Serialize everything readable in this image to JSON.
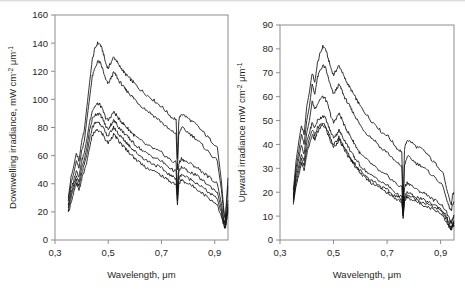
{
  "figure": {
    "panels": [
      {
        "id": "left",
        "name": "downwelling-irradiance-plot",
        "xlabel": "Wavelength, μm",
        "ylabel_main": "Downwelling irradiance, mW cm",
        "ylabel_sup1": "-2",
        "ylabel_mid": " μm",
        "ylabel_sup2": "-1",
        "xticks": [
          "0,3",
          "0,5",
          "0,7",
          "0,9"
        ],
        "xtickvals": [
          0.3,
          0.5,
          0.7,
          0.9
        ],
        "yticks": [
          "0",
          "20",
          "40",
          "60",
          "80",
          "100",
          "120",
          "140",
          "160"
        ],
        "ytickvals": [
          0,
          20,
          40,
          60,
          80,
          100,
          120,
          140,
          160
        ]
      },
      {
        "id": "right",
        "name": "upward-irradiance-plot",
        "xlabel": "Wavelength, μm",
        "ylabel_main": "Upward irradiance mW cm",
        "ylabel_sup1": "-2",
        "ylabel_mid": " μm",
        "ylabel_sup2": "-1",
        "xticks": [
          "0,3",
          "0,5",
          "0,7",
          "0,9"
        ],
        "xtickvals": [
          0.3,
          0.5,
          0.7,
          0.9
        ],
        "yticks": [
          "0",
          "10",
          "20",
          "30",
          "40",
          "50",
          "60",
          "70",
          "80",
          "90"
        ],
        "ytickvals": [
          0,
          10,
          20,
          30,
          40,
          50,
          60,
          70,
          80,
          90
        ]
      }
    ]
  },
  "chart_data": [
    {
      "type": "line",
      "panel": "left",
      "title": "",
      "xlabel": "Wavelength, μm",
      "ylabel": "Downwelling irradiance, mW cm-2 μm-1",
      "xlim": [
        0.3,
        0.95
      ],
      "ylim": [
        0,
        160
      ],
      "xtick_step": 0.2,
      "ytick_step": 20,
      "grid": false,
      "legend": "none",
      "n_series": 6,
      "annotations": [
        "dense Fraunhofer / atmospheric oscillations below 0.45 um",
        "broad peak near 0.47 um",
        "sharp O2 absorption notch at 0.76 um",
        "H2O absorption notch at 0.94 um"
      ],
      "x": [
        0.35,
        0.36,
        0.37,
        0.38,
        0.39,
        0.4,
        0.41,
        0.42,
        0.43,
        0.44,
        0.45,
        0.46,
        0.47,
        0.48,
        0.49,
        0.5,
        0.51,
        0.52,
        0.53,
        0.54,
        0.55,
        0.56,
        0.57,
        0.58,
        0.59,
        0.6,
        0.62,
        0.64,
        0.66,
        0.68,
        0.7,
        0.72,
        0.74,
        0.755,
        0.76,
        0.765,
        0.775,
        0.79,
        0.81,
        0.83,
        0.85,
        0.87,
        0.89,
        0.91,
        0.925,
        0.935,
        0.94,
        0.945,
        0.95
      ],
      "series": [
        {
          "name": "curve-1",
          "values": [
            30,
            44,
            52,
            62,
            56,
            70,
            78,
            95,
            112,
            128,
            136,
            140,
            139,
            134,
            126,
            122,
            126,
            130,
            128,
            124,
            122,
            119,
            117,
            115,
            113,
            111,
            107,
            104,
            101,
            98,
            95,
            91,
            87,
            86,
            58,
            85,
            90,
            88,
            85,
            82,
            78,
            74,
            70,
            66,
            42,
            20,
            16,
            30,
            44
          ]
        },
        {
          "name": "curve-2",
          "values": [
            28,
            40,
            47,
            56,
            51,
            63,
            70,
            86,
            101,
            116,
            122,
            127,
            126,
            121,
            114,
            111,
            115,
            119,
            117,
            113,
            111,
            108,
            106,
            104,
            102,
            100,
            96,
            93,
            90,
            87,
            84,
            80,
            77,
            76,
            50,
            75,
            80,
            78,
            75,
            72,
            68,
            64,
            60,
            56,
            36,
            18,
            14,
            26,
            38
          ]
        },
        {
          "name": "curve-3",
          "values": [
            25,
            36,
            42,
            50,
            45,
            56,
            62,
            72,
            84,
            92,
            95,
            97,
            96,
            92,
            87,
            85,
            88,
            91,
            89,
            86,
            84,
            82,
            80,
            78,
            76,
            74,
            71,
            68,
            66,
            64,
            62,
            59,
            56,
            55,
            36,
            54,
            58,
            56,
            54,
            52,
            49,
            46,
            43,
            40,
            26,
            14,
            11,
            19,
            28
          ]
        },
        {
          "name": "curve-4",
          "values": [
            23,
            33,
            39,
            46,
            41,
            51,
            57,
            66,
            78,
            86,
            89,
            90,
            89,
            86,
            81,
            79,
            82,
            85,
            83,
            80,
            78,
            76,
            74,
            72,
            70,
            68,
            65,
            62,
            60,
            58,
            56,
            53,
            50,
            49,
            32,
            48,
            52,
            50,
            48,
            46,
            43,
            40,
            37,
            34,
            22,
            12,
            10,
            17,
            25
          ]
        },
        {
          "name": "curve-5",
          "values": [
            21,
            30,
            36,
            43,
            38,
            47,
            53,
            61,
            72,
            80,
            83,
            84,
            83,
            80,
            76,
            74,
            77,
            80,
            78,
            75,
            73,
            71,
            69,
            67,
            65,
            63,
            60,
            57,
            55,
            53,
            51,
            48,
            45,
            44,
            28,
            43,
            47,
            45,
            43,
            41,
            38,
            35,
            32,
            29,
            19,
            11,
            9,
            15,
            23
          ]
        },
        {
          "name": "curve-6",
          "values": [
            19,
            27,
            33,
            40,
            35,
            43,
            49,
            56,
            66,
            74,
            77,
            78,
            77,
            75,
            71,
            69,
            72,
            75,
            73,
            70,
            68,
            66,
            64,
            62,
            60,
            58,
            55,
            52,
            50,
            48,
            46,
            43,
            41,
            40,
            25,
            39,
            43,
            41,
            39,
            37,
            34,
            31,
            28,
            25,
            17,
            10,
            8,
            14,
            21
          ]
        }
      ]
    },
    {
      "type": "line",
      "panel": "right",
      "title": "",
      "xlabel": "Wavelength, μm",
      "ylabel": "Upward irradiance mW cm-2 μm-1",
      "xlim": [
        0.3,
        0.95
      ],
      "ylim": [
        0,
        90
      ],
      "xtick_step": 0.2,
      "ytick_step": 10,
      "grid": false,
      "legend": "none",
      "n_series": 6,
      "annotations": [
        "dense Fraunhofer / atmospheric oscillations below 0.45 um",
        "peak near 0.46 um",
        "sharp O2 absorption notch at 0.76 um",
        "upper two curves rise again after 0.76 um notch",
        "lower four curves converge beyond 0.8 um"
      ],
      "x": [
        0.35,
        0.36,
        0.37,
        0.38,
        0.39,
        0.4,
        0.41,
        0.42,
        0.43,
        0.44,
        0.45,
        0.46,
        0.47,
        0.48,
        0.49,
        0.5,
        0.51,
        0.52,
        0.53,
        0.54,
        0.55,
        0.56,
        0.57,
        0.58,
        0.59,
        0.6,
        0.62,
        0.64,
        0.66,
        0.68,
        0.7,
        0.72,
        0.74,
        0.755,
        0.76,
        0.765,
        0.775,
        0.79,
        0.81,
        0.83,
        0.85,
        0.87,
        0.89,
        0.91,
        0.925,
        0.935,
        0.94,
        0.945,
        0.95
      ],
      "series": [
        {
          "name": "curve-1",
          "values": [
            21,
            33,
            41,
            48,
            44,
            56,
            62,
            70,
            66,
            74,
            78,
            81,
            80,
            76,
            72,
            69,
            71,
            73,
            71,
            68,
            66,
            64,
            62,
            60,
            58,
            56,
            53,
            50,
            48,
            45,
            44,
            41,
            38,
            37,
            14,
            38,
            42,
            41,
            39,
            38,
            36,
            33,
            31,
            28,
            20,
            16,
            15,
            19,
            20
          ]
        },
        {
          "name": "curve-2",
          "values": [
            19,
            30,
            37,
            44,
            40,
            50,
            56,
            65,
            61,
            68,
            71,
            73,
            72,
            68,
            64,
            61,
            63,
            65,
            63,
            60,
            58,
            56,
            54,
            52,
            50,
            48,
            45,
            43,
            41,
            38,
            37,
            34,
            32,
            31,
            13,
            31,
            35,
            34,
            32,
            31,
            29,
            27,
            25,
            22,
            16,
            13,
            12,
            15,
            16
          ]
        },
        {
          "name": "curve-3",
          "values": [
            18,
            28,
            34,
            40,
            36,
            45,
            50,
            58,
            55,
            57,
            59,
            60,
            59,
            56,
            52,
            49,
            51,
            53,
            51,
            48,
            46,
            44,
            42,
            40,
            38,
            36,
            34,
            32,
            30,
            28,
            27,
            25,
            23,
            22,
            12,
            22,
            24,
            23,
            21,
            20,
            19,
            17,
            16,
            14,
            11,
            8,
            7,
            9,
            10
          ]
        },
        {
          "name": "curve-4",
          "values": [
            17,
            26,
            31,
            36,
            33,
            41,
            45,
            49,
            47,
            50,
            51,
            52,
            51,
            48,
            45,
            43,
            44,
            46,
            44,
            42,
            40,
            38,
            36,
            34,
            33,
            31,
            29,
            27,
            26,
            24,
            23,
            21,
            19,
            18,
            11,
            18,
            20,
            19,
            18,
            17,
            16,
            15,
            14,
            12,
            9,
            6,
            5,
            7,
            8
          ]
        },
        {
          "name": "curve-5",
          "values": [
            16,
            24,
            29,
            34,
            31,
            38,
            42,
            46,
            44,
            47,
            48,
            49,
            48,
            45,
            42,
            40,
            41,
            43,
            41,
            39,
            37,
            35,
            33,
            32,
            30,
            29,
            27,
            25,
            24,
            22,
            21,
            19,
            18,
            17,
            10,
            17,
            19,
            18,
            17,
            16,
            15,
            14,
            13,
            11,
            8,
            5,
            5,
            6,
            7
          ]
        },
        {
          "name": "curve-6",
          "values": [
            15,
            23,
            27,
            32,
            29,
            36,
            40,
            44,
            42,
            45,
            47,
            48,
            47,
            44,
            41,
            39,
            40,
            42,
            40,
            38,
            36,
            34,
            33,
            31,
            30,
            28,
            26,
            24,
            23,
            21,
            20,
            18,
            17,
            16,
            9,
            16,
            18,
            17,
            16,
            15,
            14,
            13,
            12,
            10,
            7,
            5,
            4,
            6,
            6
          ]
        }
      ]
    }
  ]
}
